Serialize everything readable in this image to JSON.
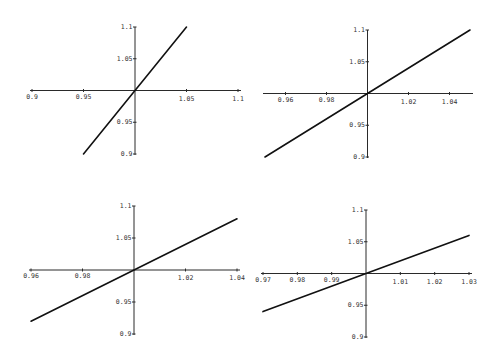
{
  "figure": {
    "line_color": "#111111",
    "axis_color": "#2a2a2a",
    "background": "#ffffff"
  },
  "chart_data": [
    {
      "type": "line",
      "panel": "top-left",
      "title": "",
      "xlabel": "",
      "ylabel": "",
      "grid": false,
      "legend": null,
      "axes_cross_at": [
        1,
        1
      ],
      "xlim": [
        0.9,
        1.1
      ],
      "ylim": [
        0.9,
        1.1
      ],
      "x_ticks": [
        "0.9",
        "0.95",
        "1.05",
        "1.1"
      ],
      "x_tick_values": [
        0.9,
        0.95,
        1.05,
        1.1
      ],
      "y_ticks": [
        "1.1",
        "1.05",
        "0.95",
        "0.9"
      ],
      "y_tick_values": [
        1.1,
        1.05,
        0.95,
        0.9
      ],
      "series": [
        {
          "name": "f(x)",
          "x": [
            0.95,
            1.0,
            1.05
          ],
          "y": [
            0.9,
            1.0,
            1.1
          ]
        }
      ],
      "px": {
        "x0": 32,
        "x1": 238,
        "y0": 154,
        "y1": 27,
        "ox": 135,
        "oy": 89
      }
    },
    {
      "type": "line",
      "panel": "top-right",
      "title": "",
      "xlabel": "",
      "ylabel": "",
      "grid": false,
      "legend": null,
      "axes_cross_at": [
        1,
        1
      ],
      "xlim": [
        0.95,
        1.05
      ],
      "ylim": [
        0.9,
        1.1
      ],
      "x_ticks": [
        "0.96",
        "0.98",
        "1.02",
        "1.04"
      ],
      "x_tick_values": [
        0.96,
        0.98,
        1.02,
        1.04
      ],
      "y_ticks": [
        "1.1",
        "1.05",
        "0.95",
        "0.9"
      ],
      "y_tick_values": [
        1.1,
        1.05,
        0.95,
        0.9
      ],
      "series": [
        {
          "name": "f(x)",
          "x": [
            0.95,
            1.0,
            1.05
          ],
          "y": [
            0.9,
            1.0,
            1.1
          ]
        }
      ],
      "px": {
        "x0": 265,
        "x1": 470,
        "y0": 157,
        "y1": 30,
        "ox": 368,
        "oy": 93
      }
    },
    {
      "type": "line",
      "panel": "bottom-left",
      "title": "",
      "xlabel": "",
      "ylabel": "",
      "grid": false,
      "legend": null,
      "axes_cross_at": [
        1,
        1
      ],
      "xlim": [
        0.96,
        1.04
      ],
      "ylim": [
        0.9,
        1.1
      ],
      "x_ticks": [
        "0.96",
        "0.98",
        "1.02",
        "1.04"
      ],
      "x_tick_values": [
        0.96,
        0.98,
        1.02,
        1.04
      ],
      "y_ticks": [
        "1.1",
        "1.05",
        "0.95",
        "0.9"
      ],
      "y_tick_values": [
        1.1,
        1.05,
        0.95,
        0.9
      ],
      "series": [
        {
          "name": "f(x)",
          "x": [
            0.96,
            1.0,
            1.04
          ],
          "y": [
            0.92,
            1.0,
            1.08
          ]
        }
      ],
      "px": {
        "x0": 31,
        "x1": 237,
        "y0": 334,
        "y1": 206,
        "ox": 134,
        "oy": 269
      }
    },
    {
      "type": "line",
      "panel": "bottom-right",
      "title": "",
      "xlabel": "",
      "ylabel": "",
      "grid": false,
      "legend": null,
      "axes_cross_at": [
        1,
        1
      ],
      "xlim": [
        0.97,
        1.03
      ],
      "ylim": [
        0.9,
        1.1
      ],
      "x_ticks": [
        "0.97",
        "0.98",
        "0.99",
        "1.01",
        "1.02",
        "1.03"
      ],
      "x_tick_values": [
        0.97,
        0.98,
        0.99,
        1.01,
        1.02,
        1.03
      ],
      "y_ticks": [
        "1.1",
        "1.05",
        "0.95",
        "0.9"
      ],
      "y_tick_values": [
        1.1,
        1.05,
        0.95,
        0.9
      ],
      "series": [
        {
          "name": "f(x)",
          "x": [
            0.97,
            1.0,
            1.03
          ],
          "y": [
            0.94,
            1.0,
            1.06
          ]
        }
      ],
      "px": {
        "x0": 263,
        "x1": 469,
        "y0": 337,
        "y1": 210,
        "ox": 366,
        "oy": 273
      }
    }
  ]
}
